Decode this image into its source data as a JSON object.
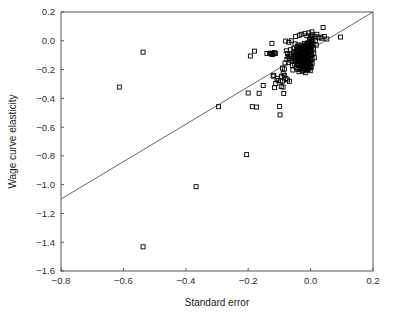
{
  "chart_data": {
    "type": "scatter",
    "title": "",
    "xlabel": "Standard error",
    "ylabel": "Wage curve elasticity",
    "xlim": [
      -0.8,
      0.2
    ],
    "ylim": [
      -1.6,
      0.2
    ],
    "xticks": [
      -0.8,
      -0.6,
      -0.4,
      -0.2,
      0.0,
      0.2
    ],
    "xtick_labels": [
      "−0.8",
      "−0.6",
      "−0.4",
      "−0.2",
      "0.0",
      "0.2"
    ],
    "yticks": [
      0.2,
      0.0,
      -0.2,
      -0.4,
      -0.6,
      -0.8,
      -1.0,
      -1.2,
      -1.4,
      -1.6
    ],
    "ytick_labels": [
      "0.2",
      "0.0",
      "−0.2",
      "−0.4",
      "−0.6",
      "−0.8",
      "−1.0",
      "−1.2",
      "−1.4",
      "−1.6"
    ],
    "grid": false,
    "legend": "none",
    "marker": {
      "shape": "open-square",
      "size": 4,
      "edge_color": "#000000",
      "face_color": "none"
    },
    "reference_line": {
      "name": "identity-line",
      "equation": "y = x",
      "x_start": -0.8,
      "y_start": -1.1,
      "x_end": 0.2,
      "y_end": 0.2,
      "color": "#555555",
      "width": 0.9
    },
    "frame": {
      "color": "#555555",
      "width": 1
    },
    "series": [
      {
        "name": "studies",
        "points": [
          [
            -0.613,
            -0.322
          ],
          [
            -0.537,
            -0.079
          ],
          [
            -0.537,
            -1.432
          ],
          [
            -0.367,
            -1.014
          ],
          [
            -0.295,
            -0.458
          ],
          [
            -0.205,
            -0.791
          ],
          [
            -0.2,
            -0.363
          ],
          [
            -0.193,
            -0.106
          ],
          [
            -0.187,
            -0.458
          ],
          [
            -0.18,
            -0.072
          ],
          [
            -0.173,
            -0.461
          ],
          [
            -0.165,
            -0.365
          ],
          [
            -0.152,
            -0.311
          ],
          [
            -0.14,
            -0.088
          ],
          [
            -0.132,
            -0.088
          ],
          [
            -0.128,
            -0.086
          ],
          [
            -0.124,
            -0.018
          ],
          [
            -0.122,
            -0.095
          ],
          [
            -0.12,
            -0.246
          ],
          [
            -0.118,
            -0.24
          ],
          [
            -0.116,
            -0.326
          ],
          [
            -0.112,
            -0.297
          ],
          [
            -0.108,
            -0.26
          ],
          [
            -0.104,
            -0.276
          ],
          [
            -0.1,
            -0.456
          ],
          [
            -0.098,
            -0.515
          ],
          [
            -0.096,
            -0.279
          ],
          [
            -0.093,
            -0.246
          ],
          [
            -0.09,
            -0.281
          ],
          [
            -0.088,
            -0.228
          ],
          [
            -0.086,
            -0.366
          ],
          [
            -0.084,
            -0.196
          ],
          [
            -0.082,
            -0.155
          ],
          [
            -0.08,
            -0.002
          ],
          [
            -0.078,
            -0.07
          ],
          [
            -0.076,
            -0.128
          ],
          [
            -0.074,
            -0.088
          ],
          [
            -0.072,
            -0.11
          ],
          [
            -0.07,
            -0.152
          ],
          [
            -0.068,
            -0.123
          ],
          [
            -0.066,
            -0.095
          ],
          [
            -0.064,
            -0.062
          ],
          [
            -0.062,
            -0.106
          ],
          [
            -0.06,
            -0.14
          ],
          [
            -0.058,
            -0.172
          ],
          [
            -0.057,
            -0.203
          ],
          [
            -0.056,
            -0.119
          ],
          [
            -0.055,
            -0.083
          ],
          [
            -0.054,
            -0.051
          ],
          [
            -0.053,
            -0.1
          ],
          [
            -0.052,
            -0.136
          ],
          [
            -0.051,
            -0.163
          ],
          [
            -0.05,
            -0.022
          ],
          [
            -0.049,
            -0.076
          ],
          [
            -0.048,
            -0.11
          ],
          [
            -0.047,
            -0.144
          ],
          [
            -0.046,
            -0.186
          ],
          [
            -0.045,
            -0.058
          ],
          [
            -0.045,
            -0.092
          ],
          [
            -0.044,
            -0.125
          ],
          [
            -0.044,
            -0.158
          ],
          [
            -0.043,
            -0.04
          ],
          [
            -0.043,
            -0.073
          ],
          [
            -0.042,
            -0.104
          ],
          [
            -0.042,
            -0.135
          ],
          [
            -0.041,
            -0.166
          ],
          [
            -0.041,
            -0.2
          ],
          [
            -0.04,
            -0.03
          ],
          [
            -0.04,
            -0.064
          ],
          [
            -0.039,
            -0.088
          ],
          [
            -0.039,
            -0.112
          ],
          [
            -0.038,
            -0.137
          ],
          [
            -0.038,
            -0.162
          ],
          [
            -0.037,
            -0.19
          ],
          [
            -0.037,
            -0.215
          ],
          [
            -0.036,
            -0.046
          ],
          [
            -0.036,
            -0.072
          ],
          [
            -0.035,
            -0.098
          ],
          [
            -0.035,
            -0.121
          ],
          [
            -0.034,
            -0.145
          ],
          [
            -0.034,
            -0.169
          ],
          [
            -0.033,
            -0.193
          ],
          [
            -0.033,
            -0.055
          ],
          [
            -0.032,
            -0.08
          ],
          [
            -0.032,
            -0.104
          ],
          [
            -0.031,
            -0.128
          ],
          [
            -0.031,
            -0.152
          ],
          [
            -0.03,
            -0.176
          ],
          [
            -0.03,
            -0.03
          ],
          [
            -0.03,
            -0.062
          ],
          [
            -0.029,
            -0.094
          ],
          [
            -0.029,
            -0.118
          ],
          [
            -0.028,
            -0.142
          ],
          [
            -0.028,
            -0.166
          ],
          [
            -0.028,
            -0.192
          ],
          [
            -0.027,
            -0.212
          ],
          [
            -0.027,
            -0.048
          ],
          [
            -0.026,
            -0.076
          ],
          [
            -0.026,
            -0.1
          ],
          [
            -0.026,
            -0.124
          ],
          [
            -0.025,
            -0.148
          ],
          [
            -0.025,
            -0.172
          ],
          [
            -0.025,
            -0.196
          ],
          [
            -0.024,
            -0.036
          ],
          [
            -0.024,
            -0.06
          ],
          [
            -0.024,
            -0.086
          ],
          [
            -0.023,
            -0.11
          ],
          [
            -0.023,
            -0.134
          ],
          [
            -0.023,
            -0.158
          ],
          [
            -0.022,
            -0.182
          ],
          [
            -0.022,
            -0.206
          ],
          [
            -0.022,
            -0.042
          ],
          [
            -0.021,
            -0.068
          ],
          [
            -0.021,
            -0.092
          ],
          [
            -0.021,
            -0.116
          ],
          [
            -0.02,
            -0.14
          ],
          [
            -0.02,
            -0.164
          ],
          [
            -0.02,
            -0.188
          ],
          [
            -0.02,
            -0.018
          ],
          [
            -0.019,
            -0.052
          ],
          [
            -0.019,
            -0.078
          ],
          [
            -0.019,
            -0.102
          ],
          [
            -0.018,
            -0.126
          ],
          [
            -0.018,
            -0.15
          ],
          [
            -0.018,
            -0.174
          ],
          [
            -0.017,
            -0.198
          ],
          [
            -0.017,
            -0.222
          ],
          [
            -0.017,
            -0.034
          ],
          [
            -0.016,
            -0.06
          ],
          [
            -0.016,
            -0.086
          ],
          [
            -0.016,
            -0.11
          ],
          [
            -0.015,
            -0.134
          ],
          [
            -0.015,
            -0.158
          ],
          [
            -0.015,
            -0.182
          ],
          [
            -0.014,
            -0.206
          ],
          [
            -0.014,
            -0.028
          ],
          [
            -0.014,
            -0.054
          ],
          [
            -0.013,
            -0.08
          ],
          [
            -0.013,
            -0.106
          ],
          [
            -0.013,
            -0.13
          ],
          [
            -0.012,
            -0.154
          ],
          [
            -0.012,
            -0.178
          ],
          [
            -0.012,
            -0.202
          ],
          [
            -0.011,
            -0.02
          ],
          [
            -0.011,
            -0.046
          ],
          [
            -0.011,
            -0.072
          ],
          [
            -0.01,
            -0.098
          ],
          [
            -0.01,
            -0.124
          ],
          [
            -0.01,
            -0.15
          ],
          [
            -0.009,
            -0.176
          ],
          [
            -0.009,
            -0.202
          ],
          [
            -0.009,
            -0.014
          ],
          [
            -0.008,
            -0.04
          ],
          [
            -0.008,
            -0.066
          ],
          [
            -0.008,
            -0.092
          ],
          [
            -0.007,
            -0.118
          ],
          [
            -0.007,
            -0.144
          ],
          [
            -0.007,
            -0.17
          ],
          [
            -0.006,
            -0.196
          ],
          [
            -0.006,
            -0.03
          ],
          [
            -0.006,
            -0.056
          ],
          [
            -0.005,
            -0.082
          ],
          [
            -0.005,
            -0.108
          ],
          [
            -0.005,
            -0.134
          ],
          [
            -0.004,
            -0.16
          ],
          [
            -0.004,
            -0.186
          ],
          [
            -0.004,
            0.01
          ],
          [
            -0.003,
            -0.024
          ],
          [
            -0.003,
            -0.05
          ],
          [
            -0.003,
            -0.078
          ],
          [
            -0.002,
            -0.104
          ],
          [
            -0.002,
            -0.13
          ],
          [
            -0.002,
            -0.156
          ],
          [
            -0.001,
            -0.182
          ],
          [
            -0.001,
            -0.208
          ],
          [
            -0.001,
            0.02
          ],
          [
            0.0,
            -0.014
          ],
          [
            0.0,
            -0.044
          ],
          [
            0.0,
            -0.074
          ],
          [
            0.001,
            -0.1
          ],
          [
            0.001,
            -0.128
          ],
          [
            0.001,
            -0.156
          ],
          [
            0.002,
            -0.184
          ],
          [
            0.002,
            0.03
          ],
          [
            0.003,
            -0.006
          ],
          [
            0.003,
            -0.036
          ],
          [
            0.004,
            -0.066
          ],
          [
            0.004,
            -0.096
          ],
          [
            0.005,
            -0.126
          ],
          [
            0.005,
            -0.156
          ],
          [
            0.006,
            0.042
          ],
          [
            0.007,
            0.008
          ],
          [
            0.008,
            -0.022
          ],
          [
            0.009,
            -0.052
          ],
          [
            0.01,
            -0.086
          ],
          [
            0.012,
            -0.118
          ],
          [
            0.014,
            0.03
          ],
          [
            0.016,
            0.0
          ],
          [
            0.018,
            -0.03
          ],
          [
            0.02,
            0.045
          ],
          [
            0.024,
            0.02
          ],
          [
            0.03,
            0.025
          ],
          [
            0.036,
            0.018
          ],
          [
            0.04,
            0.092
          ],
          [
            0.044,
            0.03
          ],
          [
            0.052,
            0.012
          ],
          [
            0.096,
            0.026
          ],
          [
            -0.062,
            0.0
          ],
          [
            -0.07,
            -0.01
          ],
          [
            -0.048,
            0.03
          ],
          [
            -0.036,
            0.038
          ],
          [
            -0.03,
            0.045
          ],
          [
            -0.018,
            0.05
          ],
          [
            -0.012,
            0.035
          ],
          [
            -0.006,
            0.055
          ],
          [
            0.004,
            0.062
          ],
          [
            -0.112,
            -0.088
          ],
          [
            -0.12,
            -0.09
          ],
          [
            -0.116,
            -0.082
          ],
          [
            -0.126,
            -0.092
          ],
          [
            -0.09,
            -0.19
          ],
          [
            -0.084,
            -0.24
          ],
          [
            -0.079,
            -0.262
          ],
          [
            -0.074,
            -0.272
          ],
          [
            -0.068,
            -0.282
          ],
          [
            -0.094,
            -0.318
          ],
          [
            -0.088,
            -0.322
          ]
        ]
      }
    ]
  },
  "axes": {
    "x_axis_name": "standard-error-axis",
    "y_axis_name": "wage-curve-elasticity-axis"
  }
}
